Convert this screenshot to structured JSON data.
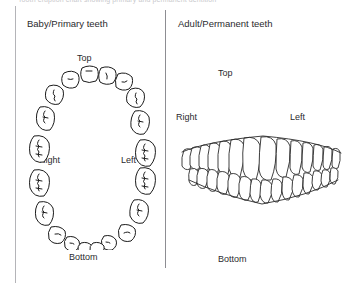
{
  "page": {
    "clipped_top_text": "Tooth eruption chart showing primary and permanent dentition",
    "background_color": "#ffffff",
    "line_color": "#1b1b1b"
  },
  "panels": [
    {
      "id": "baby",
      "title": "Baby/Primary teeth",
      "view": "occlusal arch",
      "labels": {
        "top": "Top",
        "right": "Right",
        "left": "Left",
        "bottom": "Bottom"
      },
      "tooth_count": 20,
      "upper_tooth_count": 10,
      "lower_tooth_count": 10
    },
    {
      "id": "adult",
      "title": "Adult/Permanent teeth",
      "view": "frontal smile",
      "labels": {
        "top": "Top",
        "right": "Right",
        "left": "Left",
        "bottom": "Bottom"
      },
      "tooth_count": 32,
      "upper_tooth_count": 16,
      "lower_tooth_count": 16
    }
  ]
}
